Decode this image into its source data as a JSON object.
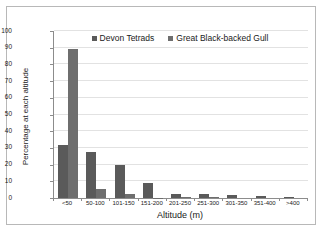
{
  "chart_data": {
    "type": "bar",
    "title": "",
    "xlabel": "Altitude (m)",
    "ylabel": "Percentage at each altitude",
    "categories": [
      "<50",
      "50-100",
      "101-150",
      "151-200",
      "201-250",
      "251-300",
      "301-350",
      "351-400",
      ">400"
    ],
    "series": [
      {
        "name": "Devon Tetrads",
        "color": "#5a5a5a",
        "values": [
          31.5,
          27.5,
          20.0,
          9.0,
          2.2,
          2.2,
          1.6,
          1.1,
          0.9
        ]
      },
      {
        "name": "Great Black-backed Gull",
        "color": "#6e6e6e",
        "values": [
          89.5,
          5.5,
          2.5,
          0.2,
          0.5,
          0.5,
          0.0,
          0.0,
          0.0
        ]
      }
    ],
    "ylim": [
      0,
      100
    ],
    "yticks": [
      0,
      10,
      20,
      30,
      40,
      50,
      60,
      70,
      80,
      90,
      100
    ],
    "ytick_labels": [
      "0",
      "10",
      "20",
      "30",
      "40",
      "50",
      "60",
      "70",
      "80",
      "90",
      "100"
    ],
    "grid": true,
    "grid_axis": "y",
    "legend_position": "top-center"
  },
  "legend": {
    "items": [
      {
        "label": "Devon Tetrads"
      },
      {
        "label": "Great Black-backed Gull"
      }
    ]
  },
  "axes": {
    "x_title": "Altitude (m)",
    "y_title": "Percentage at each altitude"
  }
}
